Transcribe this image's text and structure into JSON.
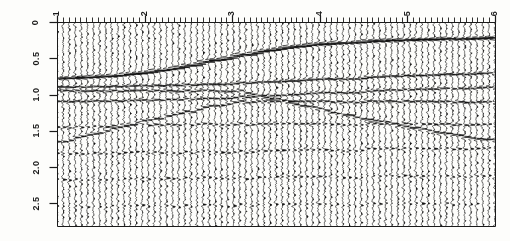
{
  "figure": {
    "type": "seismic-wiggle-section",
    "background_color": "#fdfdfb",
    "trace_color": "#111111",
    "axis_color": "#1a1a1a"
  },
  "axes": {
    "x": {
      "label": "",
      "tick_labels": [
        "1",
        "2",
        "3",
        "4",
        "5",
        "6"
      ],
      "tick_values": [
        1,
        2,
        3,
        4,
        5,
        6
      ],
      "range": [
        1,
        6
      ],
      "position": "top",
      "label_rotation_deg": -90,
      "minor_ticks_per_major": 14
    },
    "y": {
      "label": "",
      "tick_labels": [
        "0",
        "0.5",
        "1.0",
        "1.5",
        "2.0",
        "2.5"
      ],
      "tick_values": [
        0,
        0.5,
        1.0,
        1.5,
        2.0,
        2.5
      ],
      "range": [
        0,
        2.81
      ],
      "position": "left",
      "label_rotation_deg": -90
    }
  },
  "plot_box": {
    "left": 57,
    "top": 22,
    "right": 495,
    "bottom": 226
  },
  "chart_data": {
    "type": "line",
    "title": "",
    "xlabel": "",
    "ylabel": "",
    "xlim": [
      1,
      6
    ],
    "ylim": [
      0,
      2.81
    ],
    "grid": false,
    "legend": "none",
    "trace_count": 73,
    "trace_spacing_units": 0.0694,
    "samples_per_trace": 420,
    "wiggle_gain": 4.6,
    "variable_area_fill": true,
    "events": [
      {
        "name": "shallow-reflector-dipping-main",
        "description": "Strong continuous reflector rising from ~0.78 s at x=1 to ~0.22 s at x=6; steep dip between x=2 and x=3.6, flattening to the right",
        "amplitude": 1.0,
        "polarity": "positive",
        "points": [
          [
            1.0,
            0.78
          ],
          [
            1.3,
            0.765
          ],
          [
            1.6,
            0.745
          ],
          [
            1.9,
            0.715
          ],
          [
            2.2,
            0.665
          ],
          [
            2.5,
            0.6
          ],
          [
            2.8,
            0.525
          ],
          [
            3.1,
            0.455
          ],
          [
            3.4,
            0.395
          ],
          [
            3.7,
            0.345
          ],
          [
            4.0,
            0.308
          ],
          [
            4.3,
            0.285
          ],
          [
            4.6,
            0.268
          ],
          [
            4.9,
            0.255
          ],
          [
            5.2,
            0.243
          ],
          [
            5.5,
            0.233
          ],
          [
            5.8,
            0.225
          ],
          [
            6.0,
            0.22
          ]
        ]
      },
      {
        "name": "reflector-sub-horizontal-0p85",
        "description": "Moderate amplitude event near 0.88 s on the left, gently rising to 0.70 s on the right",
        "amplitude": 0.55,
        "polarity": "positive",
        "points": [
          [
            1.0,
            0.9
          ],
          [
            1.8,
            0.885
          ],
          [
            2.6,
            0.865
          ],
          [
            3.4,
            0.83
          ],
          [
            4.2,
            0.785
          ],
          [
            5.0,
            0.745
          ],
          [
            5.6,
            0.718
          ],
          [
            6.0,
            0.702
          ]
        ]
      },
      {
        "name": "reflector-sub-horizontal-1p05",
        "description": "Continuous band near 1.05 s flattening toward the right edge",
        "amplitude": 0.45,
        "polarity": "positive",
        "points": [
          [
            1.0,
            1.1
          ],
          [
            1.8,
            1.085
          ],
          [
            2.6,
            1.06
          ],
          [
            3.4,
            1.02
          ],
          [
            4.2,
            0.975
          ],
          [
            5.0,
            0.935
          ],
          [
            5.6,
            0.912
          ],
          [
            6.0,
            0.9
          ]
        ]
      },
      {
        "name": "diffraction-limb-downgoing",
        "description": "Down-dipping limb from ~0.95 s at x=3.1 to ~1.55 s at x=5.4, a diffraction tail beneath the main reflector",
        "amplitude": 0.5,
        "polarity": "positive",
        "points": [
          [
            3.05,
            0.95
          ],
          [
            3.45,
            1.06
          ],
          [
            3.85,
            1.17
          ],
          [
            4.25,
            1.27
          ],
          [
            4.65,
            1.37
          ],
          [
            5.05,
            1.46
          ],
          [
            5.45,
            1.54
          ],
          [
            5.9,
            1.62
          ]
        ]
      },
      {
        "name": "diffraction-limb-upgoing-left",
        "description": "Up-dipping limb from ~1.62 s at x=1.05 to ~1.12 s at x=2.9",
        "amplitude": 0.45,
        "polarity": "positive",
        "points": [
          [
            1.02,
            1.66
          ],
          [
            1.38,
            1.55
          ],
          [
            1.74,
            1.44
          ],
          [
            2.1,
            1.34
          ],
          [
            2.46,
            1.24
          ],
          [
            2.82,
            1.15
          ],
          [
            3.05,
            1.1
          ]
        ]
      },
      {
        "name": "reflector-1p45-left",
        "description": "Weak packet near 1.42 s confined to the left half of the section",
        "amplitude": 0.32,
        "polarity": "positive",
        "points": [
          [
            1.0,
            1.46
          ],
          [
            1.5,
            1.44
          ],
          [
            2.0,
            1.42
          ],
          [
            2.5,
            1.41
          ],
          [
            3.0,
            1.41
          ]
        ]
      },
      {
        "name": "reflector-1p78-broad",
        "description": "Low amplitude sub-horizontal event near 1.78 s across the full width",
        "amplitude": 0.26,
        "polarity": "positive",
        "points": [
          [
            1.0,
            1.82
          ],
          [
            2.0,
            1.8
          ],
          [
            3.0,
            1.79
          ],
          [
            4.0,
            1.77
          ],
          [
            5.0,
            1.75
          ],
          [
            6.0,
            1.74
          ]
        ]
      },
      {
        "name": "reflector-2p15-broad",
        "description": "Faint event near 2.15 s spanning the section",
        "amplitude": 0.2,
        "polarity": "positive",
        "points": [
          [
            1.0,
            2.18
          ],
          [
            2.0,
            2.16
          ],
          [
            3.0,
            2.15
          ],
          [
            4.0,
            2.14
          ],
          [
            5.0,
            2.13
          ],
          [
            6.0,
            2.12
          ]
        ]
      },
      {
        "name": "reflector-2p52-deep",
        "description": "Weak deep event near 2.52 s",
        "amplitude": 0.17,
        "polarity": "positive",
        "points": [
          [
            1.0,
            2.55
          ],
          [
            2.0,
            2.54
          ],
          [
            3.0,
            2.53
          ],
          [
            4.0,
            2.52
          ],
          [
            5.0,
            2.51
          ],
          [
            6.0,
            2.5
          ]
        ]
      }
    ],
    "background_noise_level": 0.14
  }
}
